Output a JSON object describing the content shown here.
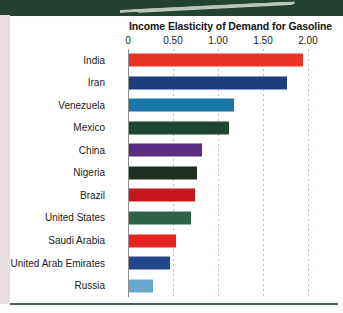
{
  "page": {
    "banner_color": "#234232",
    "rule_color": "#4a6349",
    "background": "#ffffff"
  },
  "chart": {
    "title": "Income Elasticity of Demand for Gasoline"
  },
  "chart_data": {
    "type": "bar",
    "orientation": "horizontal",
    "title": "Income Elasticity of Demand for Gasoline",
    "xlabel": "",
    "ylabel": "",
    "xlim": [
      0,
      2.0
    ],
    "grid": true,
    "legend": false,
    "tick_labels": [
      "0",
      "0.50",
      "1.00",
      "1.50",
      "2.00"
    ],
    "ticks": [
      0,
      0.5,
      1.0,
      1.5,
      2.0
    ],
    "categories": [
      "India",
      "Iran",
      "Venezuela",
      "Mexico",
      "China",
      "Nigeria",
      "Brazil",
      "United States",
      "Saudi Arabia",
      "United Arab Emirates",
      "Russia"
    ],
    "values": [
      1.93,
      1.75,
      1.17,
      1.11,
      0.81,
      0.76,
      0.73,
      0.69,
      0.52,
      0.45,
      0.27
    ],
    "colors": [
      "#ea3323",
      "#1c3f7c",
      "#1a76a8",
      "#1d4730",
      "#5b2d82",
      "#1f2f22",
      "#c8161d",
      "#2d6246",
      "#e52421",
      "#22478c",
      "#6aa7cf"
    ]
  }
}
